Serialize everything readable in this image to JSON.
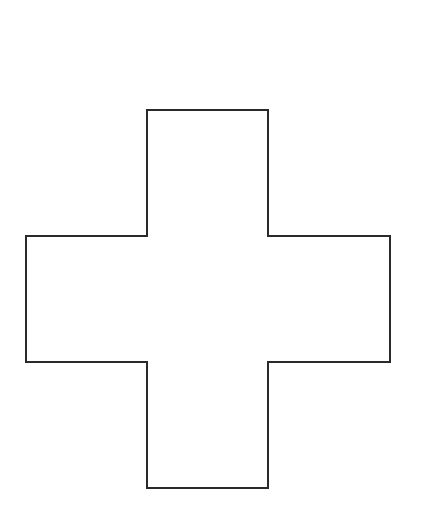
{
  "canvas": {
    "width": 426,
    "height": 527,
    "background": "#ffffff"
  },
  "shape": {
    "type": "cross",
    "stroke": "#2a2a2a",
    "stroke_width": 2,
    "fill": "#ffffff",
    "vertical_bar": {
      "x1": 147,
      "x2": 268,
      "y1": 110,
      "y2": 488
    },
    "horizontal_bar": {
      "x1": 26,
      "x2": 390,
      "y1": 236,
      "y2": 362
    },
    "points": "147,110 268,110 268,236 390,236 390,362 268,362 268,488 147,488 147,362 26,362 26,236 147,236"
  }
}
